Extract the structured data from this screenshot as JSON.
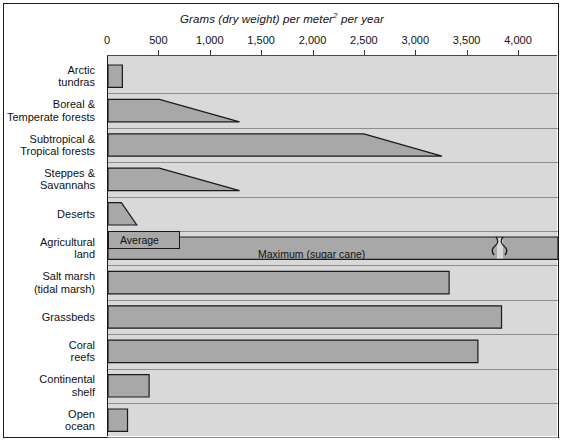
{
  "chart_data": {
    "type": "bar",
    "title": "Grams (dry weight) per meter2 per year",
    "xlabel": "Grams (dry weight) per meter2 per year",
    "ylabel": "",
    "xlim": [
      0,
      4350
    ],
    "grid": false,
    "legend": "none",
    "orientation": "horizontal",
    "axis_ticks": [
      {
        "value": 0,
        "label": "0"
      },
      {
        "value": 500,
        "label": "500"
      },
      {
        "value": 1000,
        "label": "1,000"
      },
      {
        "value": 1500,
        "label": "1,500"
      },
      {
        "value": 2000,
        "label": "2,000"
      },
      {
        "value": 2500,
        "label": "2,500"
      },
      {
        "value": 3000,
        "label": "3,000"
      },
      {
        "value": 3500,
        "label": "3,500"
      },
      {
        "value": 4000,
        "label": "4,000"
      }
    ],
    "categories": [
      "Arctic tundras",
      "Boreal & Temperate forests",
      "Subtropical & Tropical forests",
      "Steppes & Savannahs",
      "Deserts",
      "Agricultural land",
      "Salt marsh (tidal marsh)",
      "Grassbeds",
      "Coral reefs",
      "Continental shelf",
      "Open ocean"
    ],
    "bars": [
      {
        "category": "Arctic tundras",
        "shape": "rect",
        "top_end": 140,
        "bottom_end": 140,
        "start": 0
      },
      {
        "category": "Boreal & Temperate forests",
        "shape": "trapezoid",
        "top_end": 500,
        "bottom_end": 1280,
        "start": 0
      },
      {
        "category": "Subtropical & Tropical forests",
        "shape": "trapezoid",
        "top_end": 2490,
        "bottom_end": 3250,
        "start": 0
      },
      {
        "category": "Steppes & Savannahs",
        "shape": "trapezoid",
        "top_end": 500,
        "bottom_end": 1280,
        "start": 0
      },
      {
        "category": "Deserts",
        "shape": "trapezoid",
        "top_end": 130,
        "bottom_end": 280,
        "start": 0
      },
      {
        "category": "Agricultural land",
        "shape": "broken-rect",
        "top_end": 700,
        "bottom_end": 4350,
        "start": 0
      },
      {
        "category": "Salt marsh (tidal marsh)",
        "shape": "rect",
        "top_end": 3320,
        "bottom_end": 3320,
        "start": 0
      },
      {
        "category": "Grassbeds",
        "shape": "rect",
        "top_end": 3830,
        "bottom_end": 3830,
        "start": 0
      },
      {
        "category": "Coral reefs",
        "shape": "rect",
        "top_end": 3600,
        "bottom_end": 3600,
        "start": 0
      },
      {
        "category": "Continental shelf",
        "shape": "rect",
        "top_end": 400,
        "bottom_end": 400,
        "start": 0
      },
      {
        "category": "Open ocean",
        "shape": "rect",
        "top_end": 190,
        "bottom_end": 190,
        "start": 0
      }
    ],
    "annotations": [
      {
        "text": "Average",
        "category": "Agricultural land",
        "value": 700
      },
      {
        "text": "Maximum (sugar cane)",
        "category": "Agricultural land",
        "value": 2100
      }
    ],
    "colors": {
      "bar_fill": "#a8a8a8",
      "bar_stroke": "#1a1a1a",
      "plot_background": "#d9d9d9",
      "page_background": "#ffffff",
      "text": "#111111"
    }
  },
  "labels": {
    "cat_0": "Arctic\ntundras",
    "cat_1": "Boreal &\nTemperate forests",
    "cat_2": "Subtropical &\nTropical forests",
    "cat_3": "Steppes &\nSavannahs",
    "cat_4": "Deserts",
    "cat_5": "Agricultural\nland",
    "cat_6": "Salt marsh\n(tidal marsh)",
    "cat_7": "Grassbeds",
    "cat_8": "Coral\nreefs",
    "cat_9": "Continental\nshelf",
    "cat_10": "Open\nocean"
  },
  "annotations": {
    "average": "Average",
    "maximum": "Maximum (sugar cane)",
    "break_symbol": "≈"
  },
  "title_parts": {
    "before": "Grams (dry weight) per meter",
    "sup": "2",
    "after": " per year"
  }
}
